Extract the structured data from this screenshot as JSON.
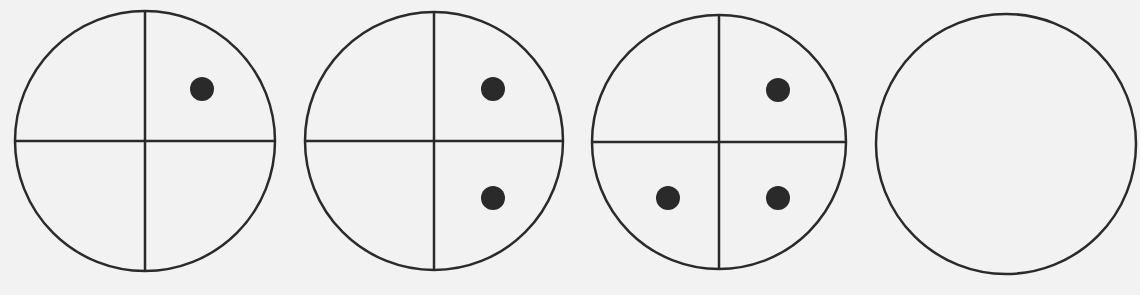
{
  "figure": {
    "type": "sequence-puzzle",
    "background": "#f2f2f2",
    "stroke_color": "#2a2a2a",
    "dot_color": "#2a2a2a",
    "panels": [
      {
        "index": 1,
        "cx": 145,
        "cy": 141,
        "r": 130,
        "divided": true,
        "dots": [
          {
            "quadrant": "top-right",
            "x": 202,
            "y": 89
          }
        ]
      },
      {
        "index": 2,
        "cx": 434,
        "cy": 141,
        "r": 129,
        "divided": true,
        "dots": [
          {
            "quadrant": "top-right",
            "x": 493,
            "y": 89
          },
          {
            "quadrant": "bottom-right",
            "x": 493,
            "y": 198
          }
        ]
      },
      {
        "index": 3,
        "cx": 719,
        "cy": 142,
        "r": 127,
        "divided": true,
        "dots": [
          {
            "quadrant": "top-right",
            "x": 778,
            "y": 90
          },
          {
            "quadrant": "bottom-left",
            "x": 668,
            "y": 198
          },
          {
            "quadrant": "bottom-right",
            "x": 778,
            "y": 198
          }
        ]
      },
      {
        "index": 4,
        "cx": 1006,
        "cy": 144,
        "r": 130,
        "divided": false,
        "dots": []
      }
    ],
    "dot_radius": 12,
    "stroke_width": 2.5
  }
}
